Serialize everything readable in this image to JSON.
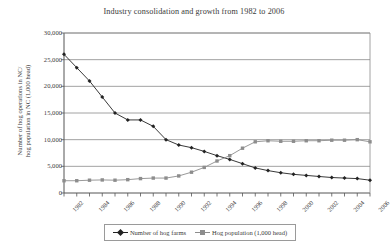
{
  "chart_data": {
    "type": "line",
    "title": "Industry consolidation and growth from 1982 to 2006",
    "xlabel": "",
    "ylabel": "Number of hog operations in NC/ hog population in NC (1,000 head)",
    "ylabel_lines": [
      "Number of hog operations in NC/",
      "hog population in NC (1,000 head)"
    ],
    "ylim": [
      0,
      30000
    ],
    "ytick_values": [
      30000,
      25000,
      20000,
      15000,
      10000,
      5000,
      0
    ],
    "ytick_labels": [
      "30,000",
      "25,000",
      "20,000",
      "15,000",
      "10,000",
      "5,000",
      "0"
    ],
    "grid": "horizontal",
    "legend_position": "bottom",
    "x": [
      1982,
      1983,
      1984,
      1985,
      1986,
      1987,
      1988,
      1989,
      1990,
      1991,
      1992,
      1993,
      1994,
      1995,
      1996,
      1997,
      1998,
      1999,
      2000,
      2001,
      2002,
      2003,
      2004,
      2005,
      2006
    ],
    "xtick_labels": [
      "1982",
      "1984",
      "1986",
      "1988",
      "1990",
      "1992",
      "1994",
      "1996",
      "1998",
      "2000",
      "2002",
      "2004",
      "2006"
    ],
    "xtick_values": [
      1982,
      1984,
      1986,
      1988,
      1990,
      1992,
      1994,
      1996,
      1998,
      2000,
      2002,
      2004,
      2006
    ],
    "series": [
      {
        "name": "Number of hog farms",
        "color": "#222222",
        "marker": "diamond",
        "values": [
          26000,
          23500,
          21000,
          18000,
          15000,
          13700,
          13700,
          12500,
          10000,
          9000,
          8500,
          7800,
          7000,
          6300,
          5500,
          4700,
          4200,
          3800,
          3500,
          3300,
          3100,
          2900,
          2800,
          2700,
          2400
        ]
      },
      {
        "name": "Hog population (1,000 head)",
        "color": "#8d8d8d",
        "marker": "square",
        "values": [
          2300,
          2300,
          2400,
          2450,
          2400,
          2500,
          2700,
          2800,
          2800,
          3200,
          3900,
          4800,
          6000,
          7000,
          8400,
          9600,
          9800,
          9700,
          9700,
          9800,
          9800,
          9900,
          9900,
          10000,
          9600
        ]
      }
    ]
  },
  "legend": {
    "entries": [
      {
        "label": "Number of hog farms"
      },
      {
        "label": "Hog population (1,000 head)"
      }
    ]
  }
}
